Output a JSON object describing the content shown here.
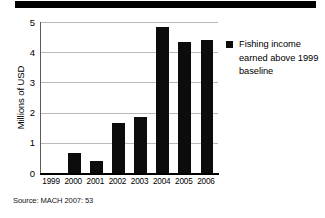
{
  "figure": {
    "source_note": "Source: MACH 2007: 53",
    "top_rule": "decorative-rule"
  },
  "legend": {
    "swatch_color": "#0c0c0c",
    "label": "Fishing income earned above 1999 baseline"
  },
  "chart_data": {
    "type": "bar",
    "title": "",
    "xlabel": "",
    "ylabel": "Millions of USD",
    "categories": [
      "1999",
      "2000",
      "2001",
      "2002",
      "2003",
      "2004",
      "2005",
      "2006"
    ],
    "values": [
      0,
      0.65,
      0.4,
      1.65,
      1.85,
      4.85,
      4.35,
      4.4
    ],
    "series": [
      {
        "name": "Fishing income earned above 1999 baseline",
        "values": [
          0,
          0.65,
          0.4,
          1.65,
          1.85,
          4.85,
          4.35,
          4.4
        ],
        "color": "#0c0c0c"
      }
    ],
    "ylim": [
      0,
      5
    ],
    "yticks": [
      0,
      1,
      2,
      3,
      4,
      5
    ],
    "ytick_labels": [
      "0",
      "1",
      "2",
      "3",
      "4",
      "5"
    ],
    "grid": "horizontal",
    "gridline_color": "#b9b9b9",
    "legend_position": "right"
  }
}
